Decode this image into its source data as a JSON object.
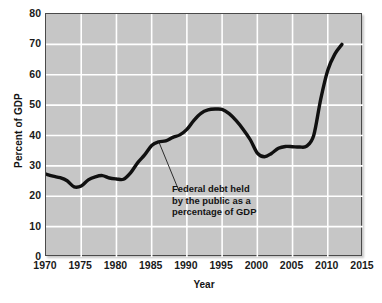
{
  "chart_data": {
    "type": "line",
    "title": "",
    "xlabel": "Year",
    "ylabel": "Percent of GDP",
    "xlim": [
      1970,
      2015
    ],
    "ylim": [
      0,
      80
    ],
    "grid": true,
    "legend": "none",
    "x_ticks": [
      "1970",
      "1975",
      "1980",
      "1985",
      "1990",
      "1995",
      "2000",
      "2005",
      "2010",
      "2015"
    ],
    "y_ticks": [
      "0",
      "10",
      "20",
      "30",
      "40",
      "50",
      "60",
      "70",
      "80"
    ],
    "series": [
      {
        "name": "Federal debt held by the public as a percentage of GDP",
        "color": "#101010",
        "x": [
          1970,
          1971,
          1972,
          1973,
          1974,
          1975,
          1976,
          1977,
          1978,
          1979,
          1980,
          1981,
          1982,
          1983,
          1984,
          1985,
          1986,
          1987,
          1988,
          1989,
          1990,
          1991,
          1992,
          1993,
          1994,
          1995,
          1996,
          1997,
          1998,
          1999,
          2000,
          2001,
          2002,
          2003,
          2004,
          2005,
          2006,
          2007,
          2008,
          2009,
          2010,
          2011,
          2012
        ],
        "values": [
          27.3,
          26.6,
          26.1,
          25.1,
          23.1,
          23.4,
          25.4,
          26.4,
          26.8,
          26.0,
          25.7,
          25.6,
          27.7,
          31.0,
          33.6,
          36.7,
          37.9,
          38.2,
          39.4,
          40.2,
          42.0,
          45.0,
          47.3,
          48.4,
          48.7,
          48.6,
          47.2,
          44.9,
          42.0,
          38.6,
          34.2,
          33.0,
          34.1,
          35.8,
          36.4,
          36.3,
          36.2,
          36.5,
          40.0,
          52.0,
          61.5,
          66.8,
          70.0
        ]
      }
    ],
    "annotations": [
      {
        "name": "series-callout",
        "lines": [
          "Federal debt held",
          "by the public as a",
          "percentage of GDP"
        ],
        "points_to_year": 1986,
        "points_to_value": 38
      }
    ]
  },
  "axes": {
    "y_title": "Percent of GDP",
    "x_title": "Year"
  },
  "style": {
    "plot_background": "#c6c6c6",
    "gridline_color": "#ffffff",
    "line_color": "#101010",
    "text_color": "#141414",
    "page_background": "#ffffff"
  }
}
